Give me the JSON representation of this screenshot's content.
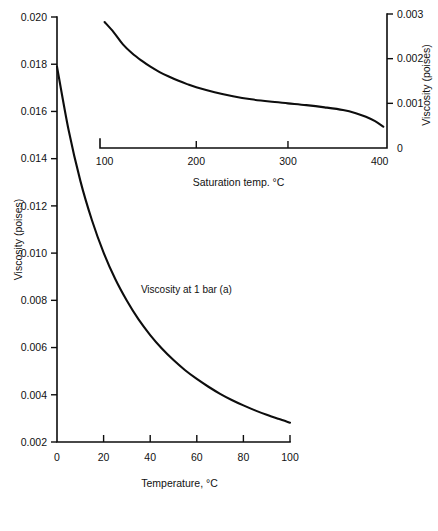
{
  "chart_data": [
    {
      "id": "main",
      "type": "line",
      "title": "",
      "xlabel": "Temperature, °C",
      "ylabel": "Viscosity (poises)",
      "xlim": [
        0,
        100
      ],
      "ylim": [
        0.002,
        0.02
      ],
      "xticks": [
        0,
        20,
        40,
        60,
        80,
        100
      ],
      "xticklabels": [
        "0",
        "20",
        "40",
        "60",
        "80",
        "100"
      ],
      "yticks": [
        0.002,
        0.004,
        0.006,
        0.008,
        0.01,
        0.012,
        0.014,
        0.016,
        0.018,
        0.02
      ],
      "yticklabels": [
        "0.002",
        "0.004",
        "0.006",
        "0.008",
        "0.010",
        "0.012",
        "0.014",
        "0.016",
        "0.018",
        "0.020"
      ],
      "grid": false,
      "legend": "none",
      "annotations": [
        {
          "text": "Viscosity at 1 bar (a)",
          "x": 36,
          "y": 0.0083
        }
      ],
      "series": [
        {
          "name": "Viscosity at 1 bar (a)",
          "x": [
            0,
            5,
            10,
            15,
            20,
            25,
            30,
            35,
            40,
            45,
            50,
            55,
            60,
            65,
            70,
            75,
            80,
            85,
            90,
            95,
            100
          ],
          "values": [
            0.0179,
            0.0152,
            0.01307,
            0.01139,
            0.01002,
            0.0089,
            0.00798,
            0.00719,
            0.00653,
            0.00596,
            0.00547,
            0.00504,
            0.00467,
            0.00434,
            0.00404,
            0.00378,
            0.00355,
            0.00334,
            0.00315,
            0.00298,
            0.00282
          ]
        }
      ]
    },
    {
      "id": "inset",
      "type": "line",
      "title": "",
      "xlabel": "Saturation temp. °C",
      "ylabel": "Viscosity (poises)",
      "xlim": [
        95,
        408
      ],
      "ylim": [
        0,
        0.003
      ],
      "xticks": [
        100,
        200,
        300,
        400
      ],
      "xticklabels": [
        "100",
        "200",
        "300",
        "400"
      ],
      "yticks": [
        0,
        0.001,
        0.002,
        0.003
      ],
      "yticklabels": [
        "0",
        "0.001",
        "0.002",
        "0.003"
      ],
      "grid": false,
      "legend": "none",
      "annotations": [],
      "series": [
        {
          "name": "Viscosity at saturation",
          "x": [
            100,
            110,
            120,
            130,
            140,
            150,
            160,
            170,
            180,
            190,
            200,
            220,
            240,
            260,
            280,
            300,
            320,
            340,
            360,
            374,
            385,
            395,
            404
          ],
          "values": [
            0.00282,
            0.00259,
            0.00232,
            0.00212,
            0.00196,
            0.00182,
            0.0017,
            0.0016,
            0.00151,
            0.00143,
            0.00136,
            0.00125,
            0.00116,
            0.00109,
            0.00104,
            0.001,
            0.00096,
            0.00091,
            0.00085,
            0.00078,
            0.0007,
            0.0006,
            0.00048
          ]
        }
      ]
    }
  ]
}
